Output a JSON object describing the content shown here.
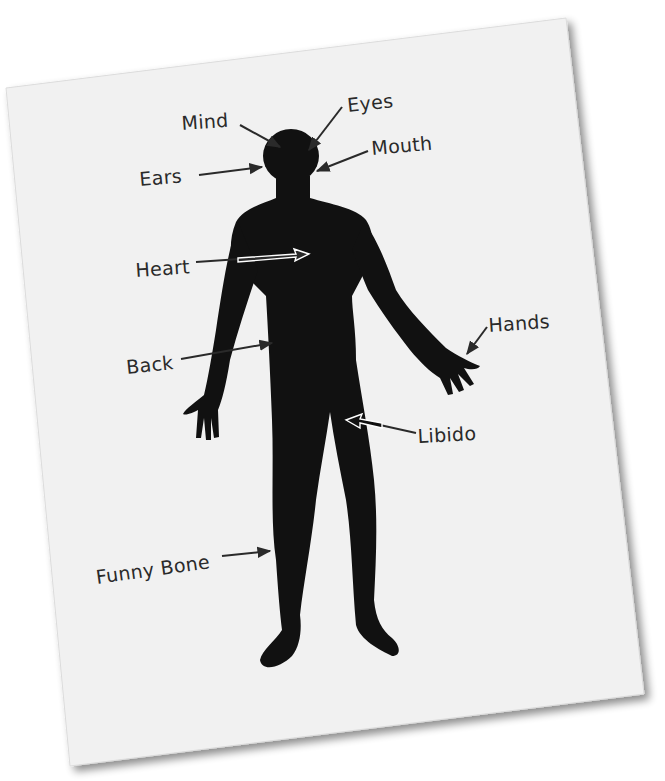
{
  "diagram": {
    "type": "labeled human body silhouette on tilted paper",
    "colors": {
      "paper": "#f1f1f1",
      "paper_shadow": "#9a9a9a",
      "silhouette": "#111111",
      "ink": "#2a2a2a",
      "arrow_outline": "#ffffff"
    },
    "labels": [
      {
        "id": "mind",
        "text": "Mind",
        "points_to": "top of head"
      },
      {
        "id": "eyes",
        "text": "Eyes",
        "points_to": "face / eyes"
      },
      {
        "id": "ears",
        "text": "Ears",
        "points_to": "side of head"
      },
      {
        "id": "mouth",
        "text": "Mouth",
        "points_to": "lower face"
      },
      {
        "id": "heart",
        "text": "Heart",
        "points_to": "chest"
      },
      {
        "id": "back",
        "text": "Back",
        "points_to": "torso side"
      },
      {
        "id": "hands",
        "text": "Hands",
        "points_to": "right hand"
      },
      {
        "id": "libido",
        "text": "Libido",
        "points_to": "groin"
      },
      {
        "id": "funny_bone",
        "text": "Funny Bone",
        "points_to": "lower leg"
      }
    ]
  }
}
